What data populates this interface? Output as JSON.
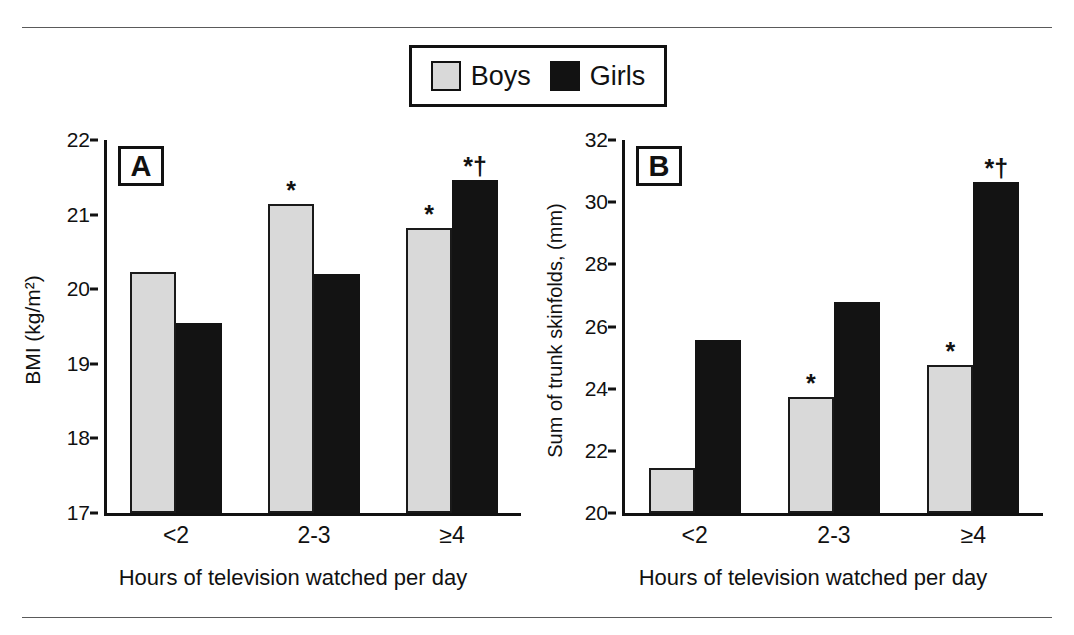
{
  "figure": {
    "legend": {
      "entries": [
        {
          "label": "Boys",
          "color": "#d9d9d9",
          "swatch": "boys-swatch"
        },
        {
          "label": "Girls",
          "color": "#131313",
          "swatch": "girls-swatch"
        }
      ]
    },
    "panels": [
      {
        "tag": "A",
        "ylabel": "BMI (kg/m²)",
        "xlabel": "Hours of television watched per day"
      },
      {
        "tag": "B",
        "ylabel": "Sum of trunk skinfolds, (mm)",
        "xlabel": "Hours of television watched per day"
      }
    ]
  },
  "chart_data": [
    {
      "type": "bar",
      "panel": "A",
      "title": "",
      "xlabel": "Hours of television watched per day",
      "ylabel": "BMI (kg/m2)",
      "categories": [
        "<2",
        "2-3",
        "≥4"
      ],
      "ylim": [
        17,
        22
      ],
      "yticks": [
        17,
        18,
        19,
        20,
        21,
        22
      ],
      "grid": false,
      "legend_position": "top-center",
      "series": [
        {
          "name": "Boys",
          "color": "#d9d9d9",
          "values": [
            20.23,
            21.14,
            20.82
          ],
          "annotations": [
            "",
            "*",
            "*"
          ]
        },
        {
          "name": "Girls",
          "color": "#131313",
          "values": [
            19.55,
            20.2,
            21.47
          ],
          "annotations": [
            "",
            "",
            "*†"
          ]
        }
      ]
    },
    {
      "type": "bar",
      "panel": "B",
      "title": "",
      "xlabel": "Hours of television watched per day",
      "ylabel": "Sum of trunk skinfolds, (mm)",
      "categories": [
        "<2",
        "2-3",
        "≥4"
      ],
      "ylim": [
        20,
        32
      ],
      "yticks": [
        20,
        22,
        24,
        26,
        28,
        30,
        32
      ],
      "grid": false,
      "legend_position": "top-center",
      "series": [
        {
          "name": "Boys",
          "color": "#d9d9d9",
          "values": [
            21.45,
            23.72,
            24.77
          ],
          "annotations": [
            "",
            "*",
            "*"
          ]
        },
        {
          "name": "Girls",
          "color": "#131313",
          "values": [
            25.58,
            26.8,
            30.65
          ],
          "annotations": [
            "",
            "",
            "*†"
          ]
        }
      ]
    }
  ]
}
